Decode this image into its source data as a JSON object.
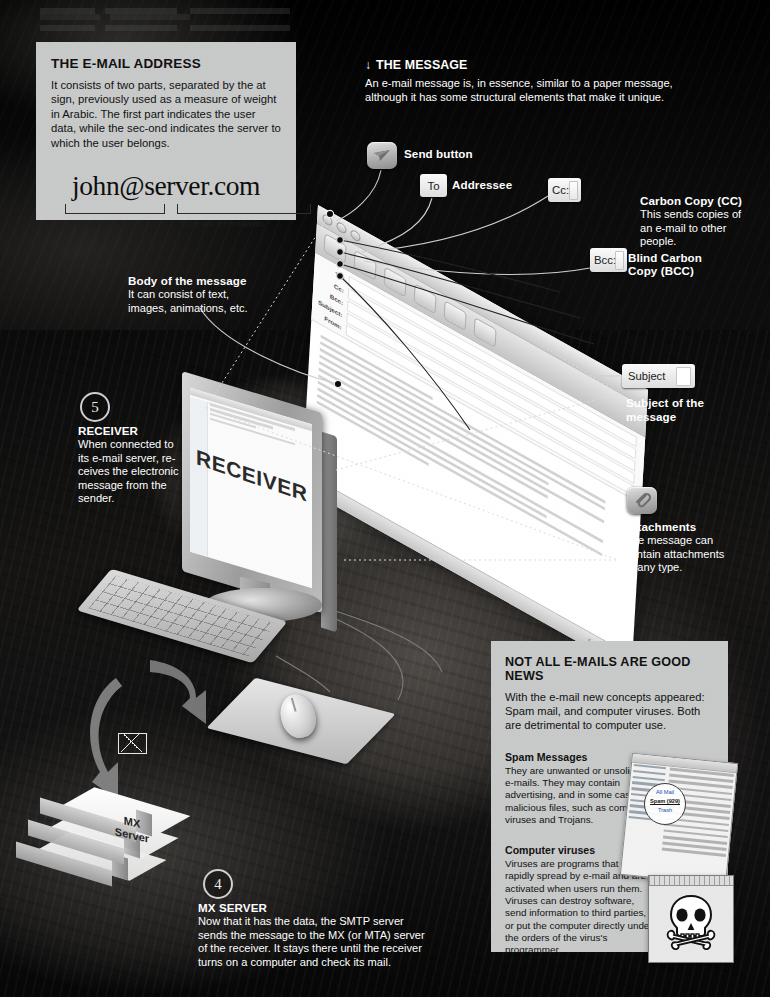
{
  "address_panel": {
    "title": "THE E-MAIL ADDRESS",
    "body": "It consists of two parts, separated by the at sign, previously used as a measure of weight in Arabic. The first part indicates the user data, while the sec-ond indicates the server to which the user belongs.",
    "address": "john@server.com",
    "user_label": "User information",
    "domain_label": "Domain information"
  },
  "message_section": {
    "arrow": "↓",
    "title": "THE MESSAGE",
    "body": "An e-mail message is, in essence, similar to a paper message, although it has some structural elements that make it unique."
  },
  "callouts": {
    "send": {
      "label": "Send button",
      "icon": "send-paper-plane-icon"
    },
    "to": {
      "chip": "To",
      "label": "Addressee"
    },
    "cc": {
      "chip": "Cc:",
      "title": "Carbon Copy (CC)",
      "body": "This sends copies of an e-mail to other people."
    },
    "bcc": {
      "chip": "Bcc:",
      "title": "Blind Carbon Copy (BCC)"
    },
    "subject": {
      "chip": "Subject",
      "title": "Subject of the message"
    },
    "attachments": {
      "title": "Attachments",
      "body": "The message can contain attachments of any type.",
      "icon": "paperclip-icon"
    },
    "body_of_message": {
      "title": "Body of the message",
      "body": "It can consist of text, images, animations, etc."
    }
  },
  "steps": {
    "receiver": {
      "number": "5",
      "title": "RECEIVER",
      "body": "When connected to its e-mail server, re-ceives the electronic message from the sender."
    },
    "mx_server": {
      "number": "4",
      "title": "MX SERVER",
      "body": "Now that it has the data, the SMTP server sends the message to the MX (or MTA) server of the receiver. It stays there until the receiver turns on a computer and check its mail."
    }
  },
  "monitor": {
    "screen_word": "RECEIVER"
  },
  "mx_box": {
    "line1": "MX",
    "line2": "Server"
  },
  "mail_window": {
    "fields": [
      "To:",
      "Cc:",
      "Bcc:",
      "Subject:",
      "From:"
    ],
    "status_left": "From",
    "status_right": "Subject"
  },
  "spam_panel": {
    "title": "NOT ALL E-MAILS ARE GOOD NEWS",
    "lead": "With the e-mail new concepts appeared: Spam mail, and computer viruses. Both are detrimental to computer use.",
    "spam": {
      "title": "Spam Messages",
      "body": "They are unwanted or unsolic-ited e-mails. They may contain advertising, and in some cases, malicious files, such as com-puter viruses and Trojans."
    },
    "viruses": {
      "title": "Computer viruses",
      "body": "Viruses are programs that can rapidly spread by e-mail and are activated when users run them. Viruses can destroy software, send information to third parties, or put the computer directly under the orders of the virus's programmer."
    },
    "magnifier": {
      "line1": "All Mail",
      "line2": "Spam (929)",
      "line3": "Trash"
    },
    "virus_icon": "skull-and-crossbones-icon"
  },
  "icons": {
    "envelope": "envelope-icon"
  },
  "colors": {
    "panel_bg": "#c8c9c9",
    "background": "#000000",
    "text_light": "#ffffff"
  }
}
